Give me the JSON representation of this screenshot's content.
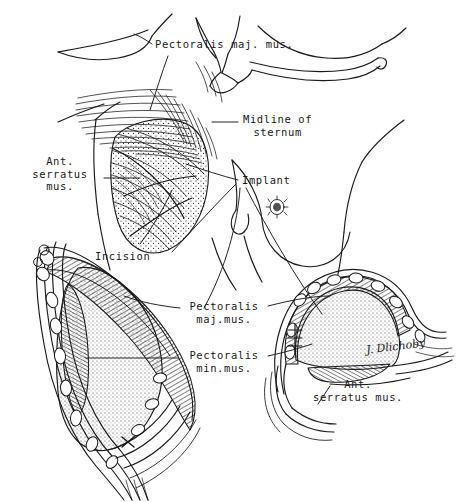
{
  "figure": {
    "type": "anatomical-line-illustration",
    "medium": "pen-and-ink stipple and hatching",
    "background_color": "#ffffff",
    "ink_color": "#1a1a1a"
  },
  "labels": {
    "pectoralis_major_top": "Pectoralis maj. mus.",
    "midline_of_sternum": "Midline of\nsternum",
    "ant_serratus_left": "Ant.\nserratus\nmus.",
    "implant": "Implant",
    "incision": "Incision",
    "pectoralis_major_mid": "Pectoralis\nmaj.mus.",
    "pectoralis_minor_mid": "Pectoralis\nmin.mus.",
    "ant_serratus_bottom": "Ant.\nserratus mus."
  },
  "signature": {
    "text": "J. Dlichoby"
  },
  "views": {
    "torso": "Anterior upper torso with clavicles, sternal notch, left pectoralis major shown in stipple and fiber hatching, right breast with nipple",
    "section_left": "Left sagittal cross-section of breast with teardrop implant beneath muscle layers and ribs",
    "section_right": "Right sagittal cross-section of breast with dome implant beneath muscle layers and ribs"
  }
}
